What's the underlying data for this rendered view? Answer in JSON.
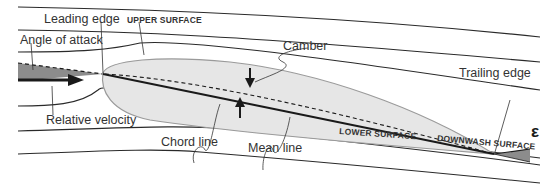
{
  "diagram": {
    "labels": {
      "leading_edge": "Leading edge",
      "upper_surface": "UPPER SURFACE",
      "angle_of_attack": "Angle of attack",
      "camber": "Camber",
      "trailing_edge": "Trailing edge",
      "relative_velocity": "Relative velocity",
      "chord_line": "Chord line",
      "mean_line": "Mean line",
      "lower_surface": "LOWER SURFACE",
      "downwash_surface": "DOWNWASH SURFACE",
      "epsilon": "ε"
    },
    "colors": {
      "airfoil_fill": "#e6e6e6",
      "airfoil_stroke": "#9a9a9a",
      "angle_fill": "#8c8c8c",
      "line": "#1a1a1a"
    }
  }
}
